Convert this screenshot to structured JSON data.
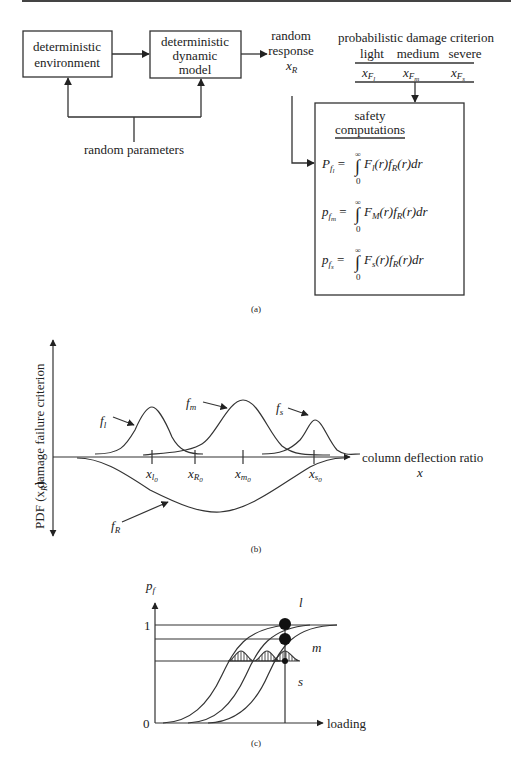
{
  "panel_a": {
    "caption": "(a)",
    "box_environment": [
      "deterministic",
      "environment"
    ],
    "box_model": [
      "deterministic",
      "dynamic",
      "model"
    ],
    "random_parameters": "random parameters",
    "random_response": [
      "random",
      "response"
    ],
    "response_symbol": "x",
    "response_sub": "R",
    "criterion_title": "probabilistic damage criterion",
    "criterion_levels": [
      "light",
      "medium",
      "severe"
    ],
    "criterion_symbols": [
      {
        "base": "x",
        "sub": "F",
        "subsub": "l"
      },
      {
        "base": "x",
        "sub": "F",
        "subsub": "m"
      },
      {
        "base": "x",
        "sub": "F",
        "subsub": "s"
      }
    ],
    "safety_title": [
      "safety",
      "computations"
    ],
    "equations": [
      {
        "lhs": "P",
        "lhs_sub": "f",
        "lhs_subsub": "l",
        "F": "F",
        "F_sub": "l",
        "rest": "(r)f",
        "R": "R",
        "tail": "(r)dr"
      },
      {
        "lhs": "p",
        "lhs_sub": "f",
        "lhs_subsub": "m",
        "F": "F",
        "F_sub": "M",
        "rest": "(r)f",
        "R": "R",
        "tail": "(r)dr"
      },
      {
        "lhs": "p",
        "lhs_sub": "f",
        "lhs_subsub": "s",
        "F": "F",
        "F_sub": "s",
        "rest": "(r)f",
        "R": "R",
        "tail": "(r)dr"
      }
    ],
    "integral_upper": "∞",
    "integral_lower": "0"
  },
  "panel_b": {
    "caption": "(b)",
    "y_label_top": "damage failure criterion",
    "y_label_bottom": "PDF (x",
    "y_label_bottom_sub": "R",
    "x_label": "column deflection ratio",
    "x_symbol": "x",
    "curves": [
      {
        "name": "f",
        "sub": "l"
      },
      {
        "name": "f",
        "sub": "m"
      },
      {
        "name": "f",
        "sub": "s"
      },
      {
        "name": "f",
        "sub": "R"
      }
    ],
    "ticks": [
      {
        "base": "x",
        "sub": "l",
        "subsub": "0"
      },
      {
        "base": "x",
        "sub": "R",
        "subsub": "0"
      },
      {
        "base": "x",
        "sub": "m",
        "subsub": "0"
      },
      {
        "base": "x",
        "sub": "s",
        "subsub": "0"
      }
    ]
  },
  "panel_c": {
    "caption": "(c)",
    "y_label": "p",
    "y_label_sub": "f",
    "y_tick_top": "1",
    "y_tick_zero": "0",
    "x_label": "loading",
    "curve_labels": [
      "l",
      "m",
      "s"
    ]
  }
}
